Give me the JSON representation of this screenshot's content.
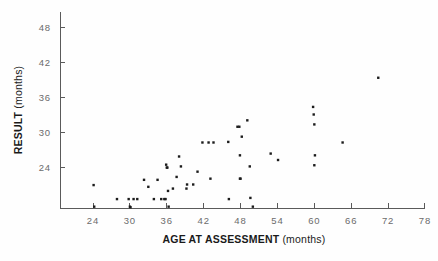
{
  "chart_data": {
    "type": "scatter",
    "title": "",
    "xlabel": "AGE AT ASSESSMENT (months)",
    "ylabel": "RESULT (months)",
    "xlabel_main": "AGE AT ASSESSMENT",
    "xlabel_units": "(months)",
    "ylabel_main": "RESULT",
    "ylabel_units": "(months)",
    "xticks": [
      24,
      30,
      36,
      42,
      48,
      54,
      60,
      66,
      72,
      78
    ],
    "yticks": [
      24,
      30,
      36,
      42,
      48
    ],
    "xtick_labels": [
      "24",
      "30",
      "36",
      "42",
      "48",
      "54",
      "60",
      "66",
      "72",
      "78"
    ],
    "ytick_labels": [
      "24",
      "30",
      "36",
      "42",
      "48"
    ],
    "xlim": [
      20.5,
      79.5
    ],
    "ylim": [
      16.9,
      50.5
    ],
    "grid": false,
    "legend": null,
    "marker": "square",
    "marker_color": "#1c1c1c",
    "axis_color": "#5a5a5a",
    "points": [
      {
        "x": 24.1,
        "y": 20.9
      },
      {
        "x": 24.2,
        "y": 17.2
      },
      {
        "x": 27.9,
        "y": 18.5
      },
      {
        "x": 29.8,
        "y": 18.5
      },
      {
        "x": 30.0,
        "y": 17.2
      },
      {
        "x": 30.1,
        "y": 17.1
      },
      {
        "x": 30.6,
        "y": 18.5
      },
      {
        "x": 31.2,
        "y": 18.5
      },
      {
        "x": 32.3,
        "y": 21.8
      },
      {
        "x": 33.0,
        "y": 20.6
      },
      {
        "x": 33.9,
        "y": 18.5
      },
      {
        "x": 34.5,
        "y": 21.8
      },
      {
        "x": 35.1,
        "y": 18.5
      },
      {
        "x": 35.6,
        "y": 18.5
      },
      {
        "x": 35.8,
        "y": 18.5
      },
      {
        "x": 35.9,
        "y": 24.4
      },
      {
        "x": 36.0,
        "y": 23.9
      },
      {
        "x": 36.1,
        "y": 23.9
      },
      {
        "x": 36.2,
        "y": 19.9
      },
      {
        "x": 36.3,
        "y": 17.2
      },
      {
        "x": 37.0,
        "y": 20.3
      },
      {
        "x": 37.6,
        "y": 22.3
      },
      {
        "x": 38.0,
        "y": 25.8
      },
      {
        "x": 38.3,
        "y": 24.1
      },
      {
        "x": 39.2,
        "y": 20.3
      },
      {
        "x": 39.3,
        "y": 21.0
      },
      {
        "x": 40.3,
        "y": 21.0
      },
      {
        "x": 41.0,
        "y": 23.2
      },
      {
        "x": 41.8,
        "y": 28.2
      },
      {
        "x": 42.8,
        "y": 28.2
      },
      {
        "x": 43.1,
        "y": 22.0
      },
      {
        "x": 43.6,
        "y": 28.2
      },
      {
        "x": 46.0,
        "y": 28.3
      },
      {
        "x": 46.1,
        "y": 18.5
      },
      {
        "x": 47.5,
        "y": 30.9
      },
      {
        "x": 47.8,
        "y": 30.9
      },
      {
        "x": 47.9,
        "y": 26.0
      },
      {
        "x": 47.9,
        "y": 22.0
      },
      {
        "x": 48.0,
        "y": 22.0
      },
      {
        "x": 48.2,
        "y": 29.2
      },
      {
        "x": 49.1,
        "y": 32.0
      },
      {
        "x": 49.5,
        "y": 24.1
      },
      {
        "x": 49.6,
        "y": 18.7
      },
      {
        "x": 50.0,
        "y": 17.2
      },
      {
        "x": 52.9,
        "y": 26.3
      },
      {
        "x": 54.1,
        "y": 25.2
      },
      {
        "x": 59.8,
        "y": 34.3
      },
      {
        "x": 59.9,
        "y": 33.0
      },
      {
        "x": 60.0,
        "y": 31.3
      },
      {
        "x": 60.1,
        "y": 26.0
      },
      {
        "x": 60.0,
        "y": 24.3
      },
      {
        "x": 64.6,
        "y": 28.2
      },
      {
        "x": 70.4,
        "y": 39.3
      }
    ],
    "n_points": 53
  }
}
